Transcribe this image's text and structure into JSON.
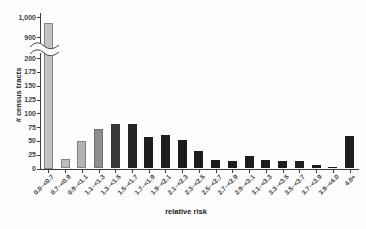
{
  "chart_data": {
    "type": "bar",
    "title": "",
    "xlabel": "relative risk",
    "ylabel": "# census tracts",
    "categories": [
      "0.0–<0.7",
      "0.7–<0.9",
      "0.9–<1.1",
      "1.1–<1.3",
      "1.3–<1.5",
      "1.5–<1.7",
      "1.7–<1.9",
      "1.9–<2.1",
      "2.1–<2.3",
      "2.3–<2.5",
      "2.5–<2.7",
      "2.7–<2.9",
      "2.9–<3.1",
      "3.1–<3.3",
      "3.3–<3.5",
      "3.5–<3.7",
      "3.7–<3.9",
      "3.9–<4.0",
      "4.0+"
    ],
    "values": [
      970,
      17,
      50,
      71,
      81,
      81,
      57,
      61,
      52,
      31,
      16,
      13,
      22,
      15,
      13,
      13,
      6,
      2,
      58
    ],
    "bar_colors": [
      "#c3c3c3",
      "#bcbcbc",
      "#b3b3b3",
      "#8e8e8e",
      "#383838",
      "#242424",
      "#1d1d1d",
      "#1d1d1d",
      "#1d1d1d",
      "#1d1d1d",
      "#1d1d1d",
      "#1d1d1d",
      "#1d1d1d",
      "#1d1d1d",
      "#1d1d1d",
      "#1d1d1d",
      "#1d1d1d",
      "#1d1d1d",
      "#1d1d1d"
    ],
    "bar_border_colors": [
      "#858585",
      "#858585",
      "#828282",
      "#6f6f6f",
      "",
      "",
      "",
      "",
      "",
      "",
      "",
      "",
      "",
      "",
      "",
      "",
      "",
      "",
      ""
    ],
    "y_ticks_lower": [
      "0",
      "25",
      "50",
      "75",
      "100",
      "125",
      "150",
      "175",
      "200"
    ],
    "y_ticks_lower_values": [
      0,
      25,
      50,
      75,
      100,
      125,
      150,
      175,
      200
    ],
    "y_ticks_upper": [
      "900",
      "1,000"
    ],
    "y_ticks_upper_values": [
      900,
      1000
    ],
    "axis_break": {
      "between_low": 200,
      "between_high": 900,
      "broken_bar_index": 0
    },
    "ylim_lower": [
      0,
      200
    ],
    "ylim_upper": [
      900,
      1000
    ],
    "grid": false,
    "legend": false,
    "axis_color": "#3a3a3a"
  }
}
